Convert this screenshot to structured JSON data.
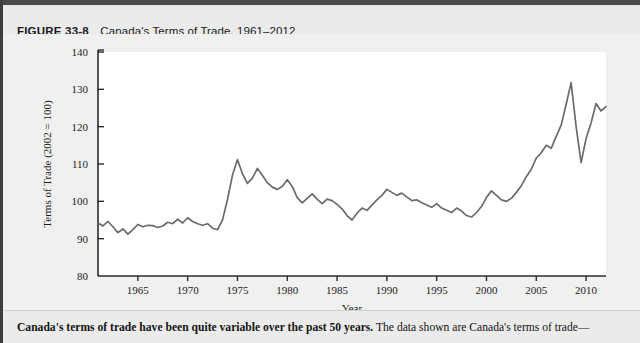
{
  "figure": {
    "number": "FIGURE 33-8",
    "title": "Canada's Terms of Trade, 1961–2012",
    "caption_lead": "Canada's terms of trade have been quite variable over the past 50 years.",
    "caption_rest": " The data shown are Canada's terms of trade—"
  },
  "colors": {
    "line": "#6b6b6b",
    "axis": "#2b2b2b",
    "panel": "#ffffff",
    "figure_background": "#f0f0f0",
    "header_rule": "#4a4a4a"
  },
  "chart_data": {
    "type": "line",
    "title": "Canada's Terms of Trade, 1961–2012",
    "xlabel": "Year",
    "ylabel": "Terms of Trade (2002 = 100)",
    "xlim": [
      1961,
      2012
    ],
    "ylim": [
      80,
      140
    ],
    "xticks": [
      1965,
      1970,
      1975,
      1980,
      1985,
      1990,
      1995,
      2000,
      2005,
      2010
    ],
    "yticks": [
      80,
      90,
      100,
      110,
      120,
      130,
      140
    ],
    "grid": false,
    "legend": null,
    "series": [
      {
        "name": "Terms of Trade (2002 = 100)",
        "x": [
          1961,
          1961.5,
          1962,
          1962.5,
          1963,
          1963.5,
          1964,
          1964.5,
          1965,
          1965.5,
          1966,
          1966.5,
          1967,
          1967.5,
          1968,
          1968.5,
          1969,
          1969.5,
          1970,
          1970.5,
          1971,
          1971.5,
          1972,
          1972.5,
          1973,
          1973.5,
          1974,
          1974.5,
          1975,
          1975.5,
          1976,
          1976.5,
          1977,
          1977.5,
          1978,
          1978.5,
          1979,
          1979.5,
          1980,
          1980.5,
          1981,
          1981.5,
          1982,
          1982.5,
          1983,
          1983.5,
          1984,
          1984.5,
          1985,
          1985.5,
          1986,
          1986.5,
          1987,
          1987.5,
          1988,
          1988.5,
          1989,
          1989.5,
          1990,
          1990.5,
          1991,
          1991.5,
          1992,
          1992.5,
          1993,
          1993.5,
          1994,
          1994.5,
          1995,
          1995.5,
          1996,
          1996.5,
          1997,
          1997.5,
          1998,
          1998.5,
          1999,
          1999.5,
          2000,
          2000.5,
          2001,
          2001.5,
          2002,
          2002.5,
          2003,
          2003.5,
          2004,
          2004.5,
          2005,
          2005.5,
          2006,
          2006.5,
          2007,
          2007.5,
          2008,
          2008.5,
          2009,
          2009.5,
          2010,
          2010.5,
          2011,
          2011.5,
          2012
        ],
        "y": [
          94.2,
          93.4,
          94.6,
          93.2,
          91.6,
          92.6,
          91.2,
          92.4,
          93.8,
          93.2,
          93.6,
          93.5,
          93.0,
          93.4,
          94.4,
          94.0,
          95.2,
          94.2,
          95.6,
          94.6,
          94.0,
          93.6,
          94.0,
          92.8,
          92.4,
          95.0,
          100.5,
          107.0,
          111.2,
          107.4,
          104.8,
          106.2,
          108.8,
          107.0,
          105.0,
          103.8,
          103.2,
          104.0,
          105.8,
          104.0,
          101.0,
          99.6,
          100.8,
          102.0,
          100.6,
          99.4,
          100.6,
          100.2,
          99.2,
          98.0,
          96.2,
          95.0,
          96.8,
          98.2,
          97.6,
          99.0,
          100.4,
          101.6,
          103.2,
          102.4,
          101.6,
          102.2,
          101.2,
          100.2,
          100.4,
          99.6,
          99.0,
          98.4,
          99.4,
          98.2,
          97.6,
          97.0,
          98.2,
          97.4,
          96.2,
          95.8,
          97.0,
          98.6,
          101.0,
          102.8,
          101.6,
          100.4,
          100.0,
          100.8,
          102.4,
          104.2,
          106.6,
          108.6,
          111.6,
          113.0,
          115.0,
          114.2,
          117.4,
          120.4,
          126.0,
          131.8,
          120.0,
          110.4,
          116.8,
          121.0,
          126.2,
          124.2,
          125.4
        ]
      }
    ]
  }
}
